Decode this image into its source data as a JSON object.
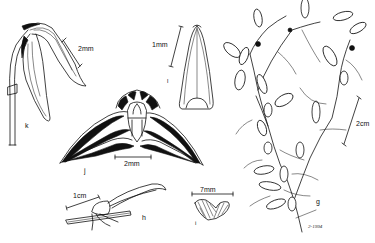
{
  "plate": {
    "type": "botanical-line-illustration",
    "background": "#ffffff",
    "ink": "#111111"
  },
  "figures": [
    {
      "id": "k",
      "label": "k",
      "scale_bar": "2mm",
      "subject": "flower, side view with pedicel"
    },
    {
      "id": "l",
      "label": "l",
      "scale_bar": "1mm",
      "subject": "petal / dorsal sepal, flattened"
    },
    {
      "id": "j",
      "label": "j",
      "scale_bar": "2mm",
      "subject": "flower, front view with spreading striped sepals"
    },
    {
      "id": "h",
      "label": "h",
      "scale_bar": "1cm",
      "subject": "leaf on rhizome segment"
    },
    {
      "id": "i",
      "label": "i",
      "scale_bar": "7mm",
      "subject": "leaf cross-section, hatched"
    },
    {
      "id": "g",
      "label": "g",
      "scale_bar": "2cm",
      "subject": "habit, branching plant with leaves"
    }
  ],
  "signature": "2-1994"
}
